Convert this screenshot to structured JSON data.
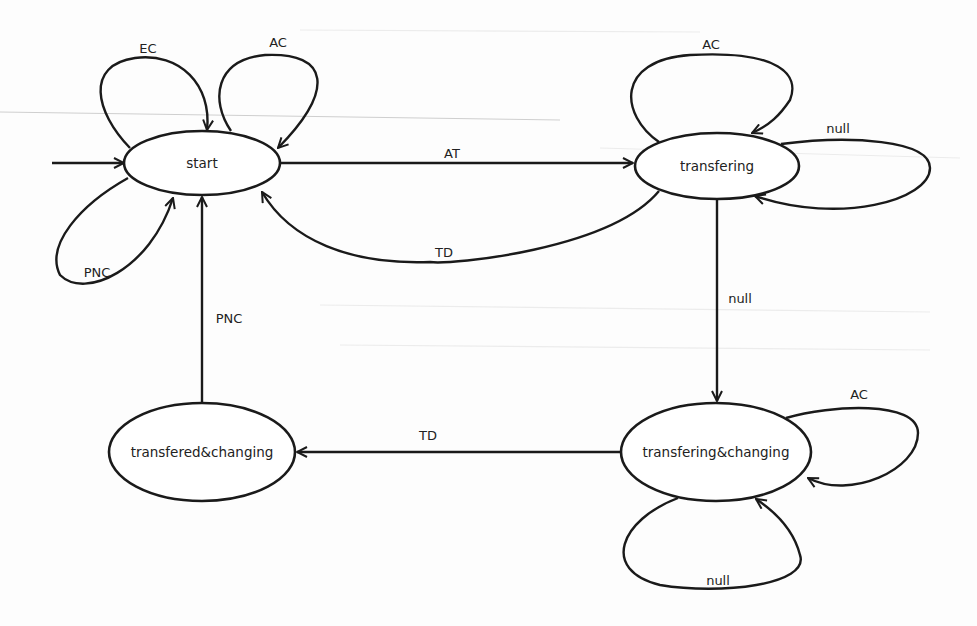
{
  "diagram": {
    "type": "state-machine",
    "colors": {
      "stroke": "#1a1a1a",
      "text": "#222222",
      "background": "#fdfdfd"
    },
    "states": [
      {
        "id": "start",
        "label": "start",
        "cx": 202,
        "cy": 163,
        "rx": 78,
        "ry": 32,
        "initial": true
      },
      {
        "id": "transfering",
        "label": "transfering",
        "cx": 717,
        "cy": 166,
        "rx": 82,
        "ry": 33
      },
      {
        "id": "transfered_changing",
        "label": "transfered&changing",
        "cx": 202,
        "cy": 452,
        "rx": 93,
        "ry": 49
      },
      {
        "id": "transfering_changing",
        "label": "transfering&changing",
        "cx": 716,
        "cy": 452,
        "rx": 95,
        "ry": 49
      }
    ],
    "transitions": [
      {
        "id": "init",
        "from": null,
        "to": "start",
        "label": "",
        "path": "M 52 163 L 124 163",
        "label_x": 0,
        "label_y": 0
      },
      {
        "id": "start-EC-start",
        "from": "start",
        "to": "start",
        "label": "EC",
        "path": "M 130 148 C 95 112, 85 65, 135 58 C 180 52, 212 85, 207 130",
        "label_x": 148,
        "label_y": 48
      },
      {
        "id": "start-AC-start",
        "from": "start",
        "to": "start",
        "label": "AC",
        "path": "M 231 131 C 210 100, 215 60, 265 55 C 330 52, 335 90, 278 148",
        "label_x": 278,
        "label_y": 42
      },
      {
        "id": "start-PNC-start",
        "from": "start",
        "to": "start",
        "label": "PNC",
        "path": "M 128 178 C 80 205, 45 245, 60 275 C 85 300, 150 270, 173 198",
        "label_x": 97,
        "label_y": 272
      },
      {
        "id": "start-AT-transfering",
        "from": "start",
        "to": "transfering",
        "label": "AT",
        "path": "M 281 163 L 633 163",
        "label_x": 452,
        "label_y": 153
      },
      {
        "id": "transfering-TD-start",
        "from": "transfering",
        "to": "start",
        "label": "TD",
        "path": "M 659 191 C 610 250, 450 265, 430 262 C 350 265, 290 240, 262 192",
        "label_x": 444,
        "label_y": 252
      },
      {
        "id": "transfering-AC-transfering",
        "from": "transfering",
        "to": "transfering",
        "label": "AC",
        "path": "M 659 142 C 620 115, 615 60, 690 55 C 780 50, 800 75, 790 100 C 780 115, 770 125, 752 133",
        "label_x": 711,
        "label_y": 44
      },
      {
        "id": "transfering-null-transfering",
        "from": "transfering",
        "to": "transfering",
        "label": "null",
        "path": "M 781 144 C 850 135, 930 140, 930 168 C 930 200, 840 225, 755 196",
        "label_x": 838,
        "label_y": 128
      },
      {
        "id": "transfering-null-transfering_changing",
        "from": "transfering",
        "to": "transfering_changing",
        "label": "null",
        "path": "M 717 199 L 717 401",
        "label_x": 740,
        "label_y": 298
      },
      {
        "id": "transfering_changing-AC-transfering_changing",
        "from": "transfering_changing",
        "to": "transfering_changing",
        "label": "AC",
        "path": "M 786 418 C 830 405, 918 400, 918 433 C 918 470, 850 500, 808 478",
        "label_x": 859,
        "label_y": 394
      },
      {
        "id": "transfering_changing-null-transfering_changing",
        "from": "transfering_changing",
        "to": "transfering_changing",
        "label": "null",
        "path": "M 678 498 C 620 520, 600 570, 660 585 C 720 595, 810 585, 800 555 C 795 535, 780 515, 756 499",
        "label_x": 718,
        "label_y": 580
      },
      {
        "id": "transfering_changing-TD-transfered_changing",
        "from": "transfering_changing",
        "to": "transfered_changing",
        "label": "TD",
        "path": "M 621 452 L 297 452",
        "label_x": 428,
        "label_y": 435
      },
      {
        "id": "transfered_changing-PNC-start",
        "from": "transfered_changing",
        "to": "start",
        "label": "PNC",
        "path": "M 202 403 L 202 197",
        "label_x": 229,
        "label_y": 318
      }
    ]
  }
}
